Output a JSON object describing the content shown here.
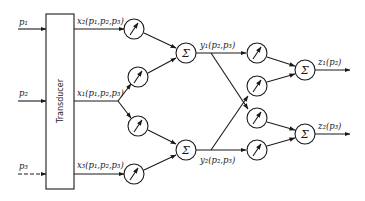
{
  "diagram": {
    "inputs": [
      {
        "label": "p₁"
      },
      {
        "label": "p₂"
      },
      {
        "label": "p₃"
      }
    ],
    "transducer_label": "Transducer",
    "transducer_outputs": [
      {
        "label": "x₂(p₁,p₂,p₃)"
      },
      {
        "label": "x₁(p₁,p₂,p₃)"
      },
      {
        "label": "x₃(p₁,p₂,p₃)"
      }
    ],
    "summer_symbol": "Σ",
    "intermediate_outputs": [
      {
        "label": "y₁(p₂,p₃)"
      },
      {
        "label": "y₂(p₂,p₃)"
      }
    ],
    "final_outputs": [
      {
        "label": "z₁(p₂)"
      },
      {
        "label": "z₂(p₃)"
      }
    ],
    "weight_icon": "gauge-needle-icon",
    "colors": {
      "stroke": "#1a1a1a",
      "background": "#ffffff"
    }
  }
}
